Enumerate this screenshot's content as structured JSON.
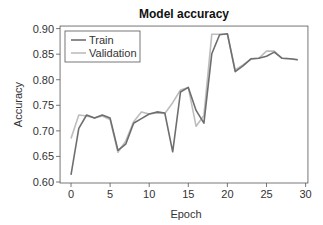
{
  "chart_data": {
    "type": "line",
    "title": "Model accuracy",
    "xlabel": "Epoch",
    "ylabel": "Accuracy",
    "xlim": [
      -1.4,
      30.3
    ],
    "ylim": [
      0.6,
      0.905
    ],
    "xticks": [
      0,
      5,
      10,
      15,
      20,
      25,
      30
    ],
    "xtick_labels": [
      "0",
      "5",
      "10",
      "15",
      "20",
      "25",
      "30"
    ],
    "yticks": [
      0.6,
      0.65,
      0.7,
      0.75,
      0.8,
      0.85,
      0.9
    ],
    "ytick_labels": [
      "0.60",
      "0.65",
      "0.70",
      "0.75",
      "0.80",
      "0.85",
      "0.90"
    ],
    "grid": false,
    "legend_position": "upper left",
    "x": [
      0,
      1,
      2,
      3,
      4,
      5,
      6,
      7,
      8,
      9,
      10,
      11,
      12,
      13,
      14,
      15,
      16,
      17,
      18,
      19,
      20,
      21,
      22,
      23,
      24,
      25,
      26,
      27,
      28,
      29
    ],
    "series": [
      {
        "name": "Train",
        "color": "#6e6e6e",
        "values": [
          0.614,
          0.705,
          0.731,
          0.725,
          0.731,
          0.725,
          0.662,
          0.674,
          0.715,
          0.724,
          0.733,
          0.737,
          0.735,
          0.659,
          0.776,
          0.785,
          0.74,
          0.715,
          0.851,
          0.888,
          0.89,
          0.816,
          0.827,
          0.841,
          0.842,
          0.846,
          0.854,
          0.842,
          0.841,
          0.839
        ]
      },
      {
        "name": "Validation",
        "color": "#bdbdbd",
        "values": [
          0.685,
          0.731,
          0.729,
          0.725,
          0.729,
          0.722,
          0.658,
          0.68,
          0.718,
          0.737,
          0.733,
          0.735,
          0.734,
          0.755,
          0.78,
          0.785,
          0.709,
          0.73,
          0.889,
          0.889,
          0.889,
          0.819,
          0.829,
          0.84,
          0.842,
          0.856,
          0.856,
          0.842,
          0.841,
          0.839
        ]
      }
    ]
  }
}
